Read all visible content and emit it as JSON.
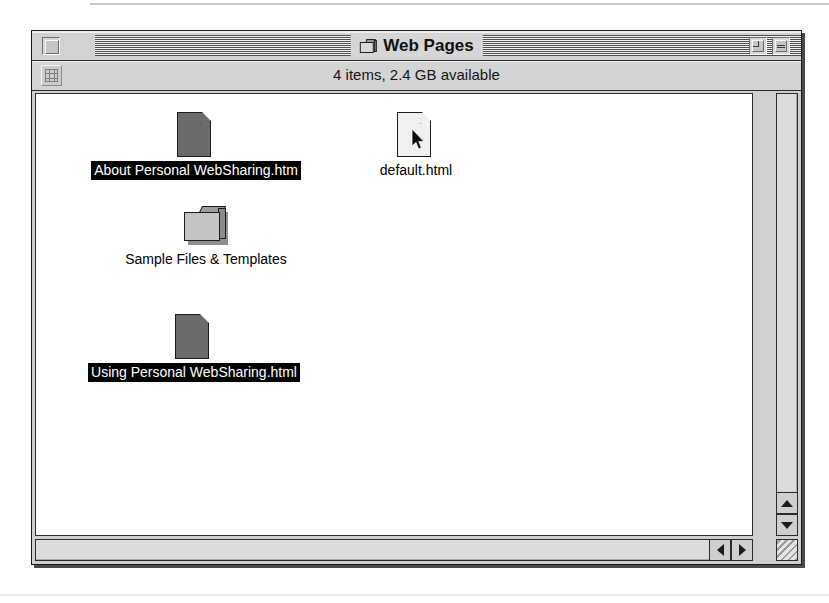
{
  "window": {
    "title": "Web Pages",
    "title_icon": "folder-icon",
    "close_box": "close-box",
    "zoom_box": "zoom-box",
    "collapse_box": "collapse-box",
    "status_text": "4 items, 2.4 GB available",
    "view_button_icon": "icon-view-grid-icon"
  },
  "items": [
    {
      "label": "About Personal WebSharing.htm",
      "icon": "document-icon",
      "kind": "document",
      "shade": "dark",
      "selected": true,
      "x": 30,
      "y": 18
    },
    {
      "label": "default.html",
      "icon": "document-icon",
      "kind": "document",
      "shade": "light",
      "selected": false,
      "x": 250,
      "y": 18,
      "cursor": "arrow-pointer-icon"
    },
    {
      "label": "Sample Files & Templates",
      "icon": "folder-icon",
      "kind": "folder",
      "shade": "light",
      "selected": false,
      "x": 40,
      "y": 110
    },
    {
      "label": "Using Personal WebSharing.html",
      "icon": "document-icon",
      "kind": "document",
      "shade": "dark",
      "selected": true,
      "x": 28,
      "y": 220
    }
  ],
  "scrollbars": {
    "vertical": {
      "up_arrow": "scroll-up-arrow-icon",
      "down_arrow": "scroll-down-arrow-icon"
    },
    "horizontal": {
      "left_arrow": "scroll-left-arrow-icon",
      "right_arrow": "scroll-right-arrow-icon"
    },
    "grow_box": "resize-grip-icon"
  },
  "colors": {
    "window_chrome": "#d2d2d2",
    "pane_background": "#ffffff",
    "selection_background": "#000000",
    "selection_text": "#ffffff",
    "border": "#1a1a1a"
  }
}
